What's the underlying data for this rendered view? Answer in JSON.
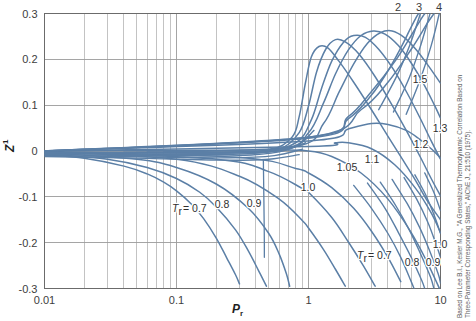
{
  "chart_data": {
    "type": "line",
    "title": "",
    "xlabel": "P_r",
    "ylabel": "Z1",
    "xscale": "log",
    "xlim": [
      0.01,
      10
    ],
    "ylim": [
      -0.3,
      0.3
    ],
    "xticks": [
      "0.01",
      "0.1",
      "1",
      "10"
    ],
    "xtick_values": [
      0.01,
      0.1,
      1,
      10
    ],
    "yticks": [
      "0.3",
      "0.2",
      "0.1",
      "0",
      "-0.1",
      "-0.2",
      "-0.3"
    ],
    "ytick_values": [
      0.3,
      0.2,
      0.1,
      0,
      -0.1,
      -0.2,
      -0.3
    ],
    "grid": true,
    "legend_position": "inline-curve-labels",
    "series_color": "#5b7fa6",
    "grid_color": "#9b9b9b",
    "series": [
      {
        "name": "Tr = 0.7",
        "label": "0.7",
        "points": [
          [
            0.01,
            -0.008
          ],
          [
            0.02,
            -0.016
          ],
          [
            0.04,
            -0.033
          ],
          [
            0.06,
            -0.05
          ],
          [
            0.08,
            -0.068
          ],
          [
            0.1,
            -0.087
          ],
          [
            0.13,
            -0.116
          ],
          [
            0.16,
            -0.147
          ],
          [
            0.2,
            -0.19
          ],
          [
            0.24,
            -0.233
          ],
          [
            0.28,
            -0.27
          ],
          [
            0.3,
            -0.29
          ]
        ]
      },
      {
        "name": "Tr = 0.8",
        "label": "0.8",
        "points": [
          [
            0.01,
            -0.006
          ],
          [
            0.03,
            -0.018
          ],
          [
            0.06,
            -0.036
          ],
          [
            0.1,
            -0.06
          ],
          [
            0.15,
            -0.09
          ],
          [
            0.2,
            -0.122
          ],
          [
            0.28,
            -0.172
          ],
          [
            0.35,
            -0.218
          ],
          [
            0.42,
            -0.262
          ],
          [
            0.48,
            -0.295
          ]
        ]
      },
      {
        "name": "Tr = 0.9",
        "label": "0.9",
        "points": [
          [
            0.01,
            -0.004
          ],
          [
            0.05,
            -0.018
          ],
          [
            0.1,
            -0.036
          ],
          [
            0.2,
            -0.072
          ],
          [
            0.35,
            -0.125
          ],
          [
            0.5,
            -0.18
          ],
          [
            0.6,
            -0.225
          ],
          [
            0.68,
            -0.268
          ],
          [
            0.72,
            -0.295
          ]
        ]
      },
      {
        "name": "Tr = 1.0",
        "label": "1.0",
        "points": [
          [
            0.01,
            -0.002
          ],
          [
            0.1,
            -0.018
          ],
          [
            0.3,
            -0.055
          ],
          [
            0.6,
            -0.105
          ],
          [
            0.9,
            -0.152
          ],
          [
            1.0,
            -0.168
          ],
          [
            1.3,
            -0.215
          ],
          [
            1.6,
            -0.258
          ],
          [
            1.9,
            -0.295
          ]
        ]
      },
      {
        "name": "Tr = 1.05",
        "label": "1.05",
        "points": [
          [
            0.01,
            -0.001
          ],
          [
            0.2,
            -0.018
          ],
          [
            0.5,
            -0.045
          ],
          [
            0.9,
            -0.082
          ],
          [
            1.0,
            -0.09
          ],
          [
            1.5,
            -0.145
          ],
          [
            2.0,
            -0.198
          ],
          [
            2.6,
            -0.25
          ],
          [
            3.2,
            -0.295
          ]
        ]
      },
      {
        "name": "Tr = 1.1",
        "label": "1.1",
        "points": [
          [
            0.01,
            -0.001
          ],
          [
            0.3,
            -0.014
          ],
          [
            0.8,
            -0.038
          ],
          [
            1.0,
            -0.048
          ],
          [
            1.5,
            -0.08
          ],
          [
            2.2,
            -0.125
          ],
          [
            3.0,
            -0.175
          ],
          [
            4.0,
            -0.232
          ],
          [
            5.0,
            -0.285
          ]
        ]
      },
      {
        "name": "Tr = 1.2",
        "label": "1.2",
        "points": [
          [
            0.01,
            0.0
          ],
          [
            0.5,
            0.002
          ],
          [
            1.0,
            0.0
          ],
          [
            1.5,
            -0.012
          ],
          [
            2.5,
            -0.048
          ],
          [
            4.0,
            -0.105
          ],
          [
            6.0,
            -0.178
          ],
          [
            8.0,
            -0.245
          ],
          [
            10.0,
            -0.305
          ]
        ]
      },
      {
        "name": "Tr = 1.3",
        "label": "1.3",
        "points": [
          [
            0.01,
            0.0
          ],
          [
            1.0,
            0.01
          ],
          [
            1.6,
            0.018
          ],
          [
            2.0,
            0.018
          ],
          [
            3.0,
            0.005
          ],
          [
            4.5,
            -0.03
          ],
          [
            6.5,
            -0.082
          ],
          [
            8.5,
            -0.135
          ],
          [
            10.0,
            -0.178
          ]
        ]
      },
      {
        "name": "Tr = 1.5",
        "label": "1.5",
        "points": [
          [
            0.01,
            0.0
          ],
          [
            1.0,
            0.022
          ],
          [
            2.0,
            0.048
          ],
          [
            3.0,
            0.06
          ],
          [
            4.0,
            0.058
          ],
          [
            5.5,
            0.045
          ],
          [
            7.0,
            0.025
          ],
          [
            8.5,
            0.005
          ],
          [
            10.0,
            -0.015
          ]
        ]
      },
      {
        "name": "Tr = 2",
        "label": "2",
        "points": [
          [
            0.01,
            0.0
          ],
          [
            1.0,
            0.028
          ],
          [
            2.0,
            0.07
          ],
          [
            3.0,
            0.122
          ],
          [
            4.0,
            0.175
          ],
          [
            5.0,
            0.225
          ],
          [
            5.8,
            0.262
          ],
          [
            6.5,
            0.29
          ],
          [
            7.0,
            0.305
          ]
        ]
      },
      {
        "name": "Tr = 3",
        "label": "3",
        "points": [
          [
            0.01,
            0.0
          ],
          [
            1.0,
            0.03
          ],
          [
            2.0,
            0.075
          ],
          [
            3.0,
            0.13
          ],
          [
            4.5,
            0.195
          ],
          [
            6.0,
            0.252
          ],
          [
            7.2,
            0.29
          ],
          [
            8.0,
            0.308
          ]
        ]
      },
      {
        "name": "Tr = 4",
        "label": "4",
        "points": [
          [
            0.01,
            0.0
          ],
          [
            1.0,
            0.03
          ],
          [
            2.5,
            0.09
          ],
          [
            4.0,
            0.15
          ],
          [
            6.0,
            0.222
          ],
          [
            8.0,
            0.28
          ],
          [
            9.2,
            0.305
          ]
        ]
      }
    ],
    "annotations": {
      "left_group": [
        {
          "text": "Tr = 0.7",
          "x": 172,
          "y": 212,
          "italic_prefix": "T",
          "sub": "r",
          "rest": " = 0.7"
        },
        {
          "text": "0.8",
          "x": 222,
          "y": 208
        },
        {
          "text": "0.9",
          "x": 254,
          "y": 207
        },
        {
          "text": "1.0",
          "x": 308,
          "y": 191
        },
        {
          "text": "1.05",
          "x": 347,
          "y": 171
        },
        {
          "text": "1.1",
          "x": 372,
          "y": 163
        },
        {
          "text": "1.2",
          "x": 421,
          "y": 148
        },
        {
          "text": "1.3",
          "x": 440,
          "y": 132
        },
        {
          "text": "1.5",
          "x": 420,
          "y": 83
        }
      ],
      "right_group": [
        {
          "text": "Tr = 0.7",
          "x": 357,
          "y": 259
        },
        {
          "text": "0.8",
          "x": 412,
          "y": 266
        },
        {
          "text": "0.9",
          "x": 433,
          "y": 266
        },
        {
          "text": "1.0",
          "x": 440,
          "y": 248
        }
      ],
      "top_group": [
        {
          "text": "2",
          "x": 398,
          "y": 11
        },
        {
          "text": "3",
          "x": 419,
          "y": 11
        },
        {
          "text": "4",
          "x": 439,
          "y": 11
        }
      ]
    }
  },
  "axes": {
    "y_label_main": "Z",
    "y_label_sup": "1",
    "x_label_main": "P",
    "x_label_sub": "r"
  },
  "credit": {
    "line1": "Based on Lee B.I., Kesler M.G., \"A Generalized Thermodynamic Correlation Based on",
    "line2": "Three-Parameter Corresponding States,\" AIChE J., 21:510 (1975)."
  },
  "colors": {
    "curve": "#5b7fa6",
    "grid": "#9c9c9c",
    "axis": "#6b6b6b",
    "text": "#3d3d3d",
    "background": "#ffffff"
  }
}
